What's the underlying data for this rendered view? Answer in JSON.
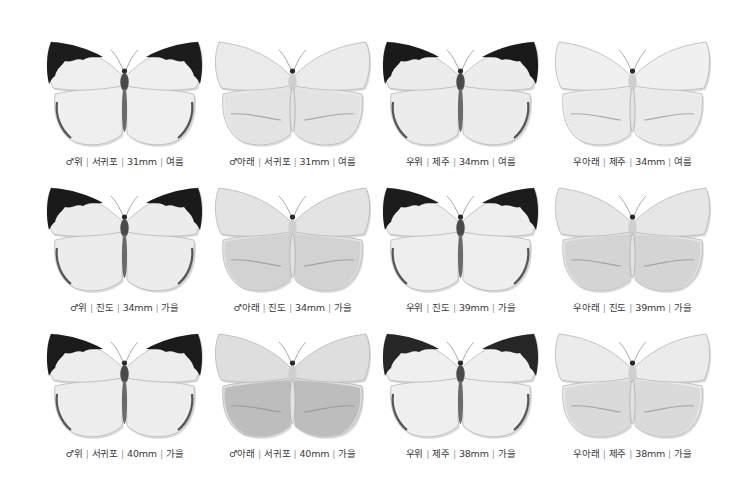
{
  "figure": {
    "background": "#ffffff",
    "caption_color": "#3a3a3a",
    "separator": "|",
    "rows": [
      {
        "specimens": [
          {
            "sex": "♂",
            "side": "위",
            "locality": "서귀포",
            "size": "31mm",
            "season": "여름",
            "view": "upper",
            "wing_tone": "#efefef",
            "apex_tone": "#1c1c1c",
            "shade_tone": "#e6e6e6"
          },
          {
            "sex": "♂",
            "side": "아래",
            "locality": "서귀포",
            "size": "31mm",
            "season": "여름",
            "view": "under",
            "wing_tone": "#ebebeb",
            "apex_tone": "#ebebeb",
            "shade_tone": "#e2e2e2"
          },
          {
            "sex": "우",
            "side": "위",
            "locality": "제주",
            "size": "34mm",
            "season": "여름",
            "view": "upper",
            "wing_tone": "#ececec",
            "apex_tone": "#1a1a1a",
            "shade_tone": "#e4e4e4"
          },
          {
            "sex": "우",
            "side": "아래",
            "locality": "제주",
            "size": "34mm",
            "season": "여름",
            "view": "under",
            "wing_tone": "#f0f0f0",
            "apex_tone": "#f0f0f0",
            "shade_tone": "#e9e9e9"
          }
        ]
      },
      {
        "specimens": [
          {
            "sex": "♂",
            "side": "위",
            "locality": "진도",
            "size": "34mm",
            "season": "가을",
            "view": "upper",
            "wing_tone": "#ececec",
            "apex_tone": "#1a1a1a",
            "shade_tone": "#e4e4e4"
          },
          {
            "sex": "♂",
            "side": "아래",
            "locality": "진도",
            "size": "34mm",
            "season": "가을",
            "view": "under",
            "wing_tone": "#e3e3e3",
            "apex_tone": "#e3e3e3",
            "shade_tone": "#cfcfcf"
          },
          {
            "sex": "우",
            "side": "위",
            "locality": "진도",
            "size": "39mm",
            "season": "가을",
            "view": "upper",
            "wing_tone": "#eeeeee",
            "apex_tone": "#1c1c1c",
            "shade_tone": "#e6e6e6"
          },
          {
            "sex": "우",
            "side": "아래",
            "locality": "진도",
            "size": "39mm",
            "season": "가을",
            "view": "under",
            "wing_tone": "#e6e6e6",
            "apex_tone": "#e6e6e6",
            "shade_tone": "#d2d2d2"
          }
        ]
      },
      {
        "specimens": [
          {
            "sex": "♂",
            "side": "위",
            "locality": "서귀포",
            "size": "40mm",
            "season": "가을",
            "view": "upper",
            "wing_tone": "#ededed",
            "apex_tone": "#1b1b1b",
            "shade_tone": "#e5e5e5"
          },
          {
            "sex": "♂",
            "side": "아래",
            "locality": "서귀포",
            "size": "40mm",
            "season": "가을",
            "view": "under",
            "wing_tone": "#dedede",
            "apex_tone": "#dedede",
            "shade_tone": "#b9b9b9"
          },
          {
            "sex": "우",
            "side": "위",
            "locality": "제주",
            "size": "38mm",
            "season": "가을",
            "view": "upper",
            "wing_tone": "#efefef",
            "apex_tone": "#262626",
            "shade_tone": "#e7e7e7"
          },
          {
            "sex": "우",
            "side": "아래",
            "locality": "제주",
            "size": "38mm",
            "season": "가을",
            "view": "under",
            "wing_tone": "#ebebeb",
            "apex_tone": "#ebebeb",
            "shade_tone": "#d8d8d8"
          }
        ]
      }
    ]
  }
}
